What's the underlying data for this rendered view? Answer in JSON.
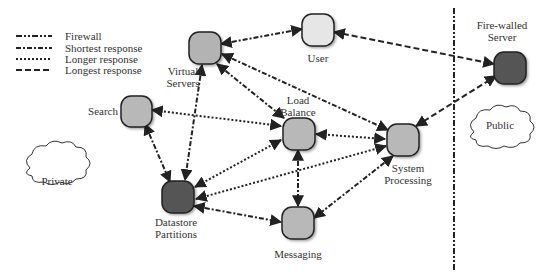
{
  "legend": {
    "items": [
      {
        "label": "Firewall",
        "style": "firewall"
      },
      {
        "label": "Shortest response",
        "style": "shortest"
      },
      {
        "label": "Longer response",
        "style": "longer"
      },
      {
        "label": "Longest response",
        "style": "longest"
      }
    ]
  },
  "zones": {
    "private": "Private",
    "public": "Public"
  },
  "nodes": {
    "virtual_servers": {
      "label1": "Virtual",
      "label2": "Servers",
      "fill": "#b3b3b3"
    },
    "user": {
      "label1": "User",
      "fill": "#e6e6e6"
    },
    "firewalled_server": {
      "label1": "Fire-walled",
      "label2": "Server",
      "fill": "#555555"
    },
    "search": {
      "label1": "Search",
      "fill": "#b8b8b8"
    },
    "load_balance": {
      "label1": "Load",
      "label2": "Balance",
      "fill": "#b8b8b8"
    },
    "system_processing": {
      "label1": "System",
      "label2": "Processing",
      "fill": "#b8b8b8"
    },
    "datastore": {
      "label1": "Datastore",
      "label2": "Partitions",
      "fill": "#555555"
    },
    "messaging": {
      "label1": "Messaging",
      "fill": "#b8b8b8"
    }
  },
  "edges": [
    {
      "from": "virtual_servers",
      "to": "user",
      "style": "shortest"
    },
    {
      "from": "user",
      "to": "firewalled_server",
      "style": "longest"
    },
    {
      "from": "virtual_servers",
      "to": "system_processing",
      "style": "shortest"
    },
    {
      "from": "virtual_servers",
      "to": "load_balance",
      "style": "shortest"
    },
    {
      "from": "virtual_servers",
      "to": "datastore",
      "style": "shortest"
    },
    {
      "from": "search",
      "to": "load_balance",
      "style": "longer"
    },
    {
      "from": "search",
      "to": "datastore",
      "style": "shortest"
    },
    {
      "from": "load_balance",
      "to": "system_processing",
      "style": "longer"
    },
    {
      "from": "load_balance",
      "to": "datastore",
      "style": "longer"
    },
    {
      "from": "system_processing",
      "to": "datastore",
      "style": "longer"
    },
    {
      "from": "load_balance",
      "to": "messaging",
      "style": "shortest"
    },
    {
      "from": "datastore",
      "to": "messaging",
      "style": "shortest"
    },
    {
      "from": "system_processing",
      "to": "messaging",
      "style": "shortest"
    },
    {
      "from": "system_processing",
      "to": "firewalled_server",
      "style": "longest"
    }
  ]
}
